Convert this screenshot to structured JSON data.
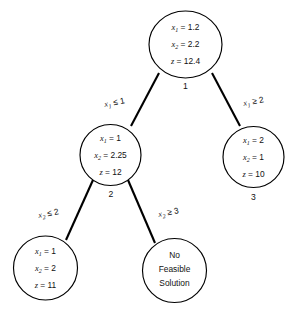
{
  "diagram": {
    "background_color": "#ffffff",
    "stroke_color": "#000000",
    "text_color": "#111111",
    "nodes": [
      {
        "id": "node-1",
        "number": "1",
        "shape": "ellipse",
        "lines": [
          {
            "var": "x",
            "sub": "1",
            "rel": "=",
            "value": "1.2"
          },
          {
            "var": "x",
            "sub": "2",
            "rel": "=",
            "value": "2.2"
          },
          {
            "var": "z",
            "sub": "",
            "rel": "=",
            "value": "12.4"
          }
        ],
        "text_lines": [
          "x1 = 1.2",
          "x2 = 2.2",
          "z = 12.4"
        ]
      },
      {
        "id": "node-2",
        "number": "2",
        "shape": "circle",
        "lines": [
          {
            "var": "x",
            "sub": "1",
            "rel": "=",
            "value": "1"
          },
          {
            "var": "x",
            "sub": "2",
            "rel": "=",
            "value": "2.25"
          },
          {
            "var": "z",
            "sub": "",
            "rel": "=",
            "value": "12"
          }
        ],
        "text_lines": [
          "x1 = 1",
          "x2 = 2.25",
          "z = 12"
        ]
      },
      {
        "id": "node-3",
        "number": "3",
        "shape": "circle",
        "lines": [
          {
            "var": "x",
            "sub": "1",
            "rel": "=",
            "value": "2"
          },
          {
            "var": "x",
            "sub": "2",
            "rel": "=",
            "value": "1"
          },
          {
            "var": "z",
            "sub": "",
            "rel": "=",
            "value": "10"
          }
        ],
        "text_lines": [
          "x1 = 2",
          "x2 = 1",
          "z = 10"
        ]
      },
      {
        "id": "node-4",
        "number": "",
        "shape": "circle",
        "lines": [
          {
            "var": "x",
            "sub": "1",
            "rel": "=",
            "value": "1"
          },
          {
            "var": "x",
            "sub": "2",
            "rel": "=",
            "value": "2"
          },
          {
            "var": "z",
            "sub": "",
            "rel": "=",
            "value": "11"
          }
        ],
        "text_lines": [
          "x1 = 1",
          "x2 = 2",
          "z = 11"
        ]
      },
      {
        "id": "node-5",
        "number": "",
        "shape": "circle",
        "lines": [],
        "text_lines": [
          "No",
          "Feasible",
          "Solution"
        ]
      }
    ],
    "edges": [
      {
        "id": "edge-1-2",
        "from": "node-1",
        "to": "node-2",
        "label": {
          "var": "x",
          "sub": "1",
          "rel": "≤",
          "value": "1"
        },
        "label_text": "x1 ≤ 1"
      },
      {
        "id": "edge-1-3",
        "from": "node-1",
        "to": "node-3",
        "label": {
          "var": "x",
          "sub": "1",
          "rel": "≥",
          "value": "2"
        },
        "label_text": "x1 ≥ 2"
      },
      {
        "id": "edge-2-4",
        "from": "node-2",
        "to": "node-4",
        "label": {
          "var": "x",
          "sub": "2",
          "rel": "≤",
          "value": "2"
        },
        "label_text": "x2 ≤ 2"
      },
      {
        "id": "edge-2-5",
        "from": "node-2",
        "to": "node-5",
        "label": {
          "var": "x",
          "sub": "2",
          "rel": "≥",
          "value": "3"
        },
        "label_text": "x2 ≥ 3"
      }
    ],
    "node_numbers": {
      "root": "1",
      "left": "2",
      "right": "3"
    },
    "infeasible_label": {
      "line1": "No",
      "line2": "Feasible",
      "line3": "Solution"
    }
  }
}
